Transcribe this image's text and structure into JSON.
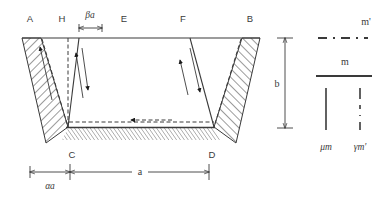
{
  "figure": {
    "vertex_labels": {
      "top_left": "A",
      "top_inner_left": "H",
      "top_mid": "E",
      "top_inner_right": "F",
      "top_right": "B",
      "bottom_left": "C",
      "bottom_right": "D"
    },
    "dimensions": {
      "top_offset": "βa",
      "height": "b",
      "base": "a",
      "left_offset": "αa"
    },
    "legend": {
      "entries": [
        {
          "label": "m'",
          "style": "dashed"
        },
        {
          "label": "m",
          "style": "solid"
        },
        {
          "label": "μm",
          "style": "solid-vertical"
        },
        {
          "label": "γm'",
          "style": "dashed-vertical"
        }
      ]
    },
    "colors": {
      "line": "#3a3a3a",
      "hatch": "#3a3a3a",
      "text": "#3a3a3a",
      "background": "#ffffff"
    }
  }
}
